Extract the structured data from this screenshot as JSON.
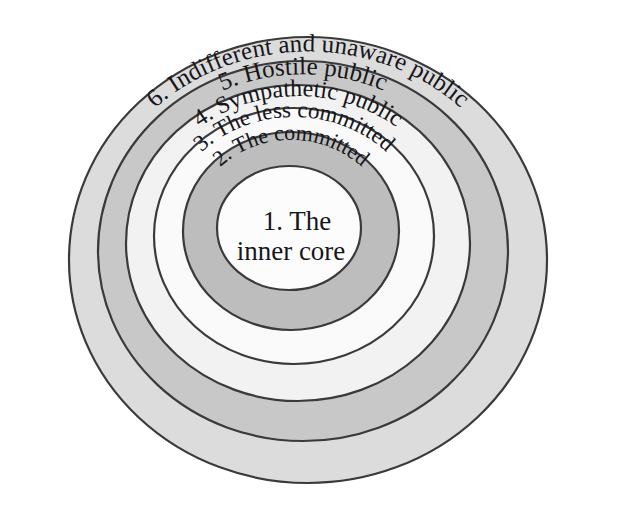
{
  "figure": {
    "background_color": "#ffffff",
    "stroke_color": "#3a3a3c",
    "text_color": "#16161a"
  },
  "chart_data": {
    "type": "pie",
    "layout": "nested concentric ellipses, labels curved along each band's arc",
    "rings": [
      {
        "index": 6,
        "label": "6. Indifferent and unaware public",
        "fill": "#dcdcdc",
        "rx": 239,
        "ry": 223,
        "cx": 308,
        "cy": 260,
        "font_size": 25,
        "label_radius_ratio": 0.935
      },
      {
        "index": 5,
        "label": "5. Hostile public",
        "fill": "#c8c8c8",
        "rx": 205,
        "ry": 190,
        "cx": 303,
        "cy": 251,
        "font_size": 25,
        "label_radius_ratio": 0.93
      },
      {
        "index": 4,
        "label": "4. Sympathetic public",
        "fill": "#f2f2f2",
        "rx": 172,
        "ry": 158,
        "cx": 298,
        "cy": 243,
        "font_size": 24,
        "label_radius_ratio": 0.93
      },
      {
        "index": 3,
        "label": "3. The less committed",
        "fill": "#fafafa",
        "rx": 140,
        "ry": 128,
        "cx": 294,
        "cy": 236,
        "font_size": 23,
        "label_radius_ratio": 0.93
      },
      {
        "index": 2,
        "label": "2. The committed",
        "fill": "#bdbdbd",
        "rx": 108,
        "ry": 99,
        "cx": 291,
        "cy": 231,
        "font_size": 22,
        "label_radius_ratio": 0.92
      },
      {
        "index": 1,
        "label": "1. The\ninner core",
        "label_line_1": "1. The",
        "label_line_2": "inner core",
        "fill": "#fcfcfc",
        "rx": 72,
        "ry": 62,
        "cx": 289,
        "cy": 228,
        "font_size": 27,
        "label_radius_ratio": 0
      }
    ],
    "categories": [
      "1. The inner core",
      "2. The committed",
      "3. The less committed",
      "4. Sympathetic public",
      "5. Hostile public",
      "6. Indifferent and unaware public"
    ],
    "values": [
      1,
      2,
      3,
      4,
      5,
      6
    ],
    "xlabel": "",
    "ylabel": "",
    "legend": "none",
    "grid": false
  }
}
